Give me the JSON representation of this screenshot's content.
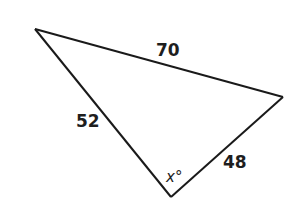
{
  "figure": {
    "type": "triangle",
    "sides": [
      {
        "id": "top",
        "label": "70",
        "value": 70
      },
      {
        "id": "left",
        "label": "52",
        "value": 52
      },
      {
        "id": "right",
        "label": "48",
        "value": 48
      }
    ],
    "angle": {
      "label": "x°",
      "variable": "x",
      "unit": "degrees",
      "vertex": "bottom"
    },
    "colors": {
      "stroke": "#1a1a1a",
      "text": "#1e1e1e",
      "background": "#ffffff"
    }
  }
}
